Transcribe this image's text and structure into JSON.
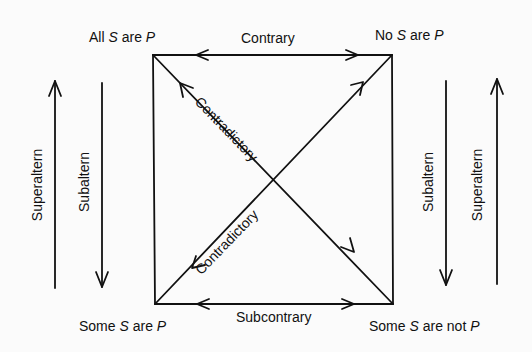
{
  "diagram": {
    "corners": {
      "top_left": {
        "pre": "All ",
        "s": "S",
        "mid": " are ",
        "p": "P"
      },
      "top_right": {
        "pre": "No ",
        "s": "S",
        "mid": " are ",
        "p": "P"
      },
      "bottom_left": {
        "pre": "Some ",
        "s": "S",
        "mid": " are ",
        "p": "P"
      },
      "bottom_right": {
        "pre": "Some ",
        "s": "S",
        "mid": " are not ",
        "p": "P"
      }
    },
    "relations": {
      "top": "Contrary",
      "bottom": "Subcontrary",
      "diagonal_a": "Contradictory",
      "diagonal_b": "Contradictory",
      "left_outer": "Superaltern",
      "left_inner": "Subaltern",
      "right_inner": "Subaltern",
      "right_outer": "Superaltern"
    },
    "stroke_color": "#111111",
    "background_color": "#fbfbfb"
  }
}
